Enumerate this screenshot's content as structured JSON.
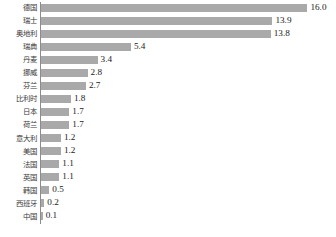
{
  "chart_data": {
    "type": "bar",
    "orientation": "horizontal",
    "title": "",
    "subtitle": "",
    "xlabel": "",
    "ylabel": "",
    "grid": false,
    "legend": false,
    "legend_position": "none",
    "axis_visible": {
      "x": false,
      "y": true
    },
    "xlim": [
      0,
      16.0
    ],
    "categories": [
      "德国",
      "瑞士",
      "奥地利",
      "瑞典",
      "丹麦",
      "挪威",
      "芬兰",
      "比利时",
      "日本",
      "荷兰",
      "意大利",
      "美国",
      "法国",
      "英国",
      "韩国",
      "西班牙",
      "中国"
    ],
    "values": [
      16.0,
      13.9,
      13.8,
      5.4,
      3.4,
      2.8,
      2.7,
      1.8,
      1.7,
      1.7,
      1.2,
      1.2,
      1.1,
      1.1,
      0.5,
      0.2,
      0.1
    ],
    "value_labels": [
      "16.0",
      "13.9",
      "13.8",
      "5.4",
      "3.4",
      "2.8",
      "2.7",
      "1.8",
      "1.7",
      "1.7",
      "1.2",
      "1.2",
      "1.1",
      "1.1",
      "0.5",
      "0.2",
      "0.1"
    ],
    "colors": {
      "bar": "#a9a9a9",
      "axis": "#8c8c8c",
      "background": "#ffffff",
      "category_text": "#3a3a3a",
      "value_text": "#222222"
    }
  }
}
